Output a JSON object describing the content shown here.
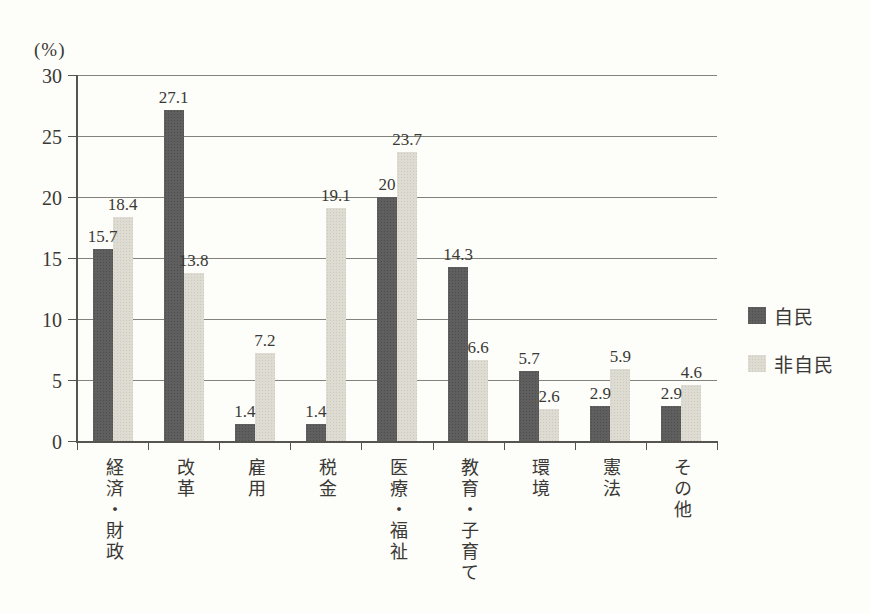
{
  "chart_data": {
    "type": "bar",
    "title": "",
    "ylabel": "(%)",
    "xlabel": "",
    "categories": [
      "経済・財政",
      "改革",
      "雇用",
      "税金",
      "医療・福祉",
      "教育・子育て",
      "環境",
      "憲法",
      "その他"
    ],
    "series": [
      {
        "name": "自民",
        "color": "#5f5f5f",
        "values": [
          15.7,
          27.1,
          1.4,
          1.4,
          20,
          14.3,
          5.7,
          2.9,
          2.9
        ]
      },
      {
        "name": "非自民",
        "color": "#dedcd2",
        "values": [
          18.4,
          13.8,
          7.2,
          19.1,
          23.7,
          6.6,
          2.6,
          5.9,
          4.6
        ]
      }
    ],
    "ylim": [
      0,
      30
    ],
    "yticks": [
      0,
      5,
      10,
      15,
      20,
      25,
      30
    ],
    "grid": true,
    "legend_position": "right",
    "axis_color": "#55544f",
    "grid_color": "#84837b",
    "text_color": "#3a3935"
  }
}
